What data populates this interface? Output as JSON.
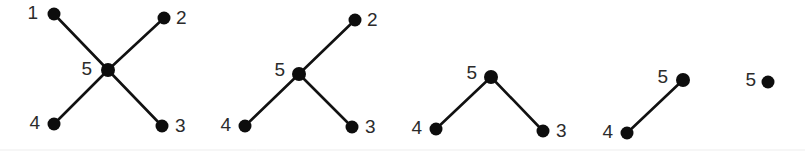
{
  "figure": {
    "width": 805,
    "height": 157,
    "background_color": "#ffffff",
    "node_color": "#0d0d0d",
    "edge_color": "#111111",
    "label_color": "#2b2b2b",
    "node_radius": 6.5,
    "hub_radius": 7.0,
    "edge_width": 2.6
  },
  "graphs": [
    {
      "id": "graph-1",
      "nodes": [
        {
          "label": "1",
          "x": 54,
          "y": 14,
          "r": 6.5,
          "label_x": 38,
          "label_y": 14,
          "label_side": "left"
        },
        {
          "label": "2",
          "x": 164,
          "y": 18,
          "r": 6.5,
          "label_x": 176,
          "label_y": 19,
          "label_side": "right"
        },
        {
          "label": "3",
          "x": 162,
          "y": 126,
          "r": 6.5,
          "label_x": 175,
          "label_y": 127,
          "label_side": "right"
        },
        {
          "label": "4",
          "x": 54,
          "y": 124,
          "r": 6.5,
          "label_x": 40,
          "label_y": 124,
          "label_side": "left"
        },
        {
          "label": "5",
          "x": 108,
          "y": 70,
          "r": 7.0,
          "label_x": 92,
          "label_y": 70,
          "label_side": "left"
        }
      ],
      "edges": [
        {
          "from": "1",
          "to": "5"
        },
        {
          "from": "2",
          "to": "5"
        },
        {
          "from": "3",
          "to": "5"
        },
        {
          "from": "4",
          "to": "5"
        }
      ]
    },
    {
      "id": "graph-2",
      "nodes": [
        {
          "label": "2",
          "x": 355,
          "y": 20,
          "r": 6.5,
          "label_x": 367,
          "label_y": 21,
          "label_side": "right"
        },
        {
          "label": "3",
          "x": 352,
          "y": 127,
          "r": 6.5,
          "label_x": 365,
          "label_y": 128,
          "label_side": "right"
        },
        {
          "label": "4",
          "x": 245,
          "y": 126,
          "r": 6.5,
          "label_x": 231,
          "label_y": 126,
          "label_side": "left"
        },
        {
          "label": "5",
          "x": 299,
          "y": 74,
          "r": 7.0,
          "label_x": 285,
          "label_y": 71,
          "label_side": "left"
        }
      ],
      "edges": [
        {
          "from": "2",
          "to": "5"
        },
        {
          "from": "3",
          "to": "5"
        },
        {
          "from": "4",
          "to": "5"
        }
      ]
    },
    {
      "id": "graph-3",
      "nodes": [
        {
          "label": "3",
          "x": 543,
          "y": 131,
          "r": 6.5,
          "label_x": 556,
          "label_y": 132,
          "label_side": "right"
        },
        {
          "label": "4",
          "x": 436,
          "y": 129,
          "r": 6.5,
          "label_x": 422,
          "label_y": 129,
          "label_side": "left"
        },
        {
          "label": "5",
          "x": 491,
          "y": 77,
          "r": 7.0,
          "label_x": 477,
          "label_y": 74,
          "label_side": "left"
        }
      ],
      "edges": [
        {
          "from": "3",
          "to": "5"
        },
        {
          "from": "4",
          "to": "5"
        }
      ]
    },
    {
      "id": "graph-4",
      "nodes": [
        {
          "label": "4",
          "x": 627,
          "y": 133,
          "r": 6.5,
          "label_x": 613,
          "label_y": 133,
          "label_side": "left"
        },
        {
          "label": "5",
          "x": 683,
          "y": 80,
          "r": 7.0,
          "label_x": 668,
          "label_y": 78,
          "label_side": "left"
        }
      ],
      "edges": [
        {
          "from": "4",
          "to": "5"
        }
      ]
    },
    {
      "id": "graph-5",
      "nodes": [
        {
          "label": "5",
          "x": 768,
          "y": 82,
          "r": 6.5,
          "label_x": 756,
          "label_y": 81,
          "label_side": "left"
        }
      ],
      "edges": []
    }
  ],
  "baseline_rule": {
    "y": 150,
    "x1": 0,
    "x2": 805,
    "color": "#ededed"
  }
}
